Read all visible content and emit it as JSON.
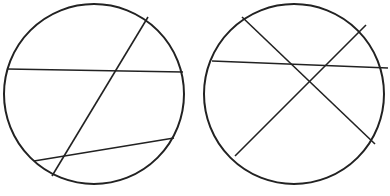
{
  "diagram": {
    "title": "Two circles divided by chords",
    "stroke_color": "#222222",
    "background": "#ffffff",
    "circles": [
      {
        "id": "left",
        "cx": 94,
        "cy": 94,
        "r": 90,
        "chords": [
          {
            "x1": 7,
            "y1": 69,
            "x2": 183,
            "y2": 72
          },
          {
            "x1": 148,
            "y1": 17,
            "x2": 52,
            "y2": 176
          },
          {
            "x1": 34,
            "y1": 161,
            "x2": 174,
            "y2": 138
          }
        ]
      },
      {
        "id": "right",
        "cx": 294,
        "cy": 94,
        "r": 90,
        "chords": [
          {
            "x1": 212,
            "y1": 61,
            "x2": 388,
            "y2": 68
          },
          {
            "x1": 242,
            "y1": 17,
            "x2": 375,
            "y2": 144
          },
          {
            "x1": 366,
            "y1": 25,
            "x2": 235,
            "y2": 156
          }
        ]
      }
    ]
  }
}
